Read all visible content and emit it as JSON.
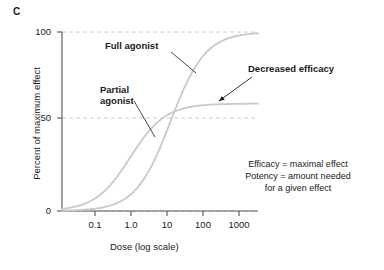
{
  "figure": {
    "panel_label": "C"
  },
  "chart_data": {
    "type": "line",
    "title": "",
    "xlabel": "Dose (log scale)",
    "ylabel": "Percent of maximum effect",
    "xscale": "log",
    "xlim": [
      0.02,
      1500
    ],
    "ylim": [
      0,
      100
    ],
    "grid": true,
    "grid_style": "dashed horizontal gridlines at 0, 50, 100",
    "legend_position": "inline annotations",
    "xticks": [
      {
        "value": 0.1,
        "label": "0.1"
      },
      {
        "value": 1.0,
        "label": "1.0"
      },
      {
        "value": 10,
        "label": "10"
      },
      {
        "value": 100,
        "label": "100"
      },
      {
        "value": 1000,
        "label": "1000"
      }
    ],
    "yticks": [
      {
        "value": 0,
        "label": "0"
      },
      {
        "value": 50,
        "label": "50"
      },
      {
        "value": 100,
        "label": "100"
      }
    ],
    "series": [
      {
        "name": "Partial agonist",
        "emax": 60,
        "ec50": 1.0,
        "hill": 1.0,
        "color": "#c9c9c9",
        "x": [
          0.02,
          0.05,
          0.1,
          0.2,
          0.3,
          0.5,
          0.7,
          1.0,
          1.5,
          2,
          3,
          5,
          7,
          10,
          20,
          30,
          50,
          100,
          300,
          600
        ],
        "values": [
          1.2,
          2.9,
          5.5,
          10.0,
          13.8,
          20.0,
          24.7,
          30.0,
          36.0,
          40.0,
          45.0,
          50.0,
          52.5,
          54.5,
          57.1,
          58.1,
          58.8,
          59.4,
          59.8,
          59.9
        ]
      },
      {
        "name": "Full agonist",
        "emax": 100,
        "ec50": 10,
        "hill": 1.0,
        "color": "#c9c9c9",
        "x": [
          0.02,
          0.05,
          0.1,
          0.3,
          0.5,
          1.0,
          2,
          3,
          5,
          7,
          10,
          15,
          20,
          30,
          50,
          70,
          100,
          200,
          400,
          600
        ],
        "values": [
          0.2,
          0.5,
          1.0,
          2.9,
          4.8,
          9.1,
          16.7,
          23.1,
          33.3,
          41.2,
          50.0,
          60.0,
          66.7,
          75.0,
          83.3,
          87.5,
          90.9,
          95.2,
          97.6,
          98.4
        ]
      }
    ],
    "annotations": [
      {
        "name": "full-agonist",
        "text": "Full agonist",
        "bold": true,
        "leader": "line to full agonist curve"
      },
      {
        "name": "partial-agonist",
        "text": "Partial\nagonist",
        "bold": true,
        "leader": "line to partial agonist curve"
      },
      {
        "name": "decreased-efficacy",
        "text": "Decreased efficacy",
        "bold": true,
        "leader": "arrow to partial agonist plateau"
      }
    ]
  },
  "definitions": {
    "text": "Efficacy = maximal effect\nPotency = amount needed\nfor a given effect"
  },
  "colors": {
    "curve": "#c9c9c9",
    "axis": "#555555",
    "grid": "#cccccc",
    "text": "#1a1a1a"
  }
}
